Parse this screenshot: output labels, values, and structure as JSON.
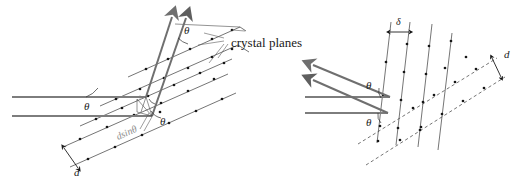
{
  "figure": {
    "background_color": "#ffffff",
    "ink_color": "#1a1a1a",
    "ray_color": "#7d7d7d",
    "atom_color": "#161616",
    "faint_label_color": "#8c8c8c"
  },
  "labels": {
    "crystal_planes": "crystal planes",
    "theta_left_incident": "θ",
    "theta_left_upper": "θ",
    "theta_left_lower": "θ",
    "path_difference": "dsinθ",
    "d_spacing_left": "d",
    "delta_right": "δ",
    "theta_right_upper": "θ",
    "theta_right_lower": "θ",
    "d_spacing_right": "d"
  },
  "panels": [
    {
      "id": "left-panel",
      "name": "perspective-view",
      "description": "Three-dimensional perspective view of a stack of crystal planes with incident horizontal rays, diffracted rays leaving upward, and the path difference d sin theta marked between adjacent planes.",
      "elements": [
        "incident-ray-upper",
        "incident-ray-lower",
        "diffracted-ray-upper",
        "diffracted-ray-lower",
        "crystal-plane-rows",
        "atom-dots",
        "path-difference-marker",
        "interplanar-spacing-marker"
      ]
    },
    {
      "id": "right-panel",
      "name": "edge-on-view",
      "description": "Edge-on view of the same crystal planes showing the incoming horizontal beams, the back-reflected beams at angle theta, the plane separation delta at the top, and the interplanar spacing d at the right.",
      "elements": [
        "incident-ray-upper",
        "incident-ray-lower",
        "reflected-ray-upper",
        "reflected-ray-lower",
        "plane-traces",
        "atom-dots",
        "delta-marker",
        "d-marker",
        "dashed-plane-traces"
      ]
    }
  ]
}
